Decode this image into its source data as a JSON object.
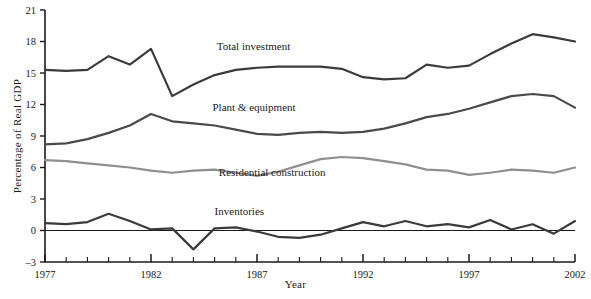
{
  "chart_data": {
    "type": "line",
    "title": "",
    "xlabel": "Year",
    "ylabel": "Percentage of Real GDP",
    "xlim": [
      1977,
      2002
    ],
    "ylim": [
      -3,
      21
    ],
    "yticks": [
      -3,
      0,
      3,
      6,
      9,
      12,
      15,
      18,
      21
    ],
    "ytick_labels": [
      "–3",
      "0",
      "3",
      "6",
      "9",
      "12",
      "15",
      "18",
      "21"
    ],
    "xticks": [
      1977,
      1982,
      1987,
      1992,
      1997,
      2002
    ],
    "xtick_labels": [
      "1977",
      "1982",
      "1987",
      "1992",
      "1997",
      "2002"
    ],
    "minor_xticks_every": 1,
    "grid": false,
    "legend_position": "inline-annotations",
    "zero_line": true,
    "x": [
      1977,
      1978,
      1979,
      1980,
      1981,
      1982,
      1983,
      1984,
      1985,
      1986,
      1987,
      1988,
      1989,
      1990,
      1991,
      1992,
      1993,
      1994,
      1995,
      1996,
      1997,
      1998,
      1999,
      2000,
      2001,
      2002
    ],
    "series": [
      {
        "name": "Total investment",
        "color": "#3b3b3b",
        "width": 2.2,
        "label_x": 1985.1,
        "label_y": 17.2,
        "values": [
          15.3,
          15.2,
          15.3,
          16.6,
          15.8,
          17.3,
          12.8,
          13.9,
          14.8,
          15.3,
          15.5,
          15.6,
          15.6,
          15.6,
          15.4,
          14.6,
          14.4,
          14.5,
          15.8,
          15.5,
          15.7,
          16.8,
          17.8,
          18.7,
          18.4,
          18.0
        ]
      },
      {
        "name": "Plant & equipment",
        "color": "#4a4a4a",
        "width": 2.2,
        "label_x": 1984.9,
        "label_y": 11.4,
        "values": [
          8.2,
          8.3,
          8.7,
          9.3,
          10.0,
          11.1,
          10.4,
          10.2,
          10.0,
          9.6,
          9.2,
          9.1,
          9.3,
          9.4,
          9.3,
          9.4,
          9.7,
          10.2,
          10.8,
          11.1,
          11.6,
          12.2,
          12.8,
          13.0,
          12.8,
          11.7
        ]
      },
      {
        "name": "Residential construction",
        "color": "#8f8f8f",
        "width": 2.2,
        "label_x": 1985.2,
        "label_y": 5.2,
        "values": [
          6.7,
          6.6,
          6.4,
          6.2,
          6.0,
          5.7,
          5.5,
          5.7,
          5.8,
          5.5,
          5.2,
          5.6,
          6.2,
          6.8,
          7.0,
          6.9,
          6.6,
          6.3,
          5.8,
          5.7,
          5.3,
          5.5,
          5.8,
          5.7,
          5.5,
          6.0
        ]
      },
      {
        "name": "Inventories",
        "color": "#3b3b3b",
        "width": 2.2,
        "label_x": 1985.0,
        "label_y": 1.5,
        "values": [
          0.7,
          0.6,
          0.8,
          1.6,
          0.9,
          0.1,
          0.2,
          -1.8,
          0.2,
          0.3,
          -0.1,
          -0.6,
          -0.7,
          -0.4,
          0.2,
          0.8,
          0.4,
          0.9,
          0.4,
          0.6,
          0.3,
          1.0,
          0.1,
          0.6,
          -0.3,
          0.9
        ]
      }
    ]
  }
}
